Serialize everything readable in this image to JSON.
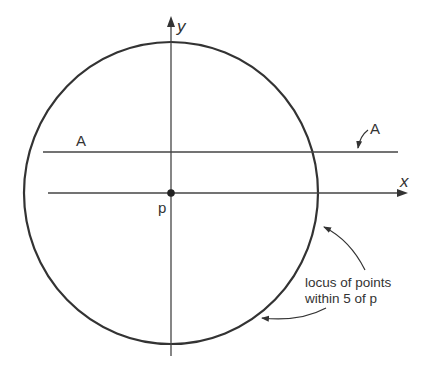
{
  "diagram": {
    "labels": {
      "y_axis": "y",
      "x_axis": "x",
      "point": "p",
      "line_left": "A",
      "line_right": "A",
      "locus_line1": "locus of points",
      "locus_line2": "within 5 of p"
    },
    "colors": {
      "stroke": "#333333",
      "text": "#333333",
      "background": "#ffffff"
    },
    "circle": {
      "cx": 171,
      "cy": 193,
      "rx": 147,
      "ry": 151
    },
    "point_p": {
      "x": 171,
      "y": 193
    }
  }
}
